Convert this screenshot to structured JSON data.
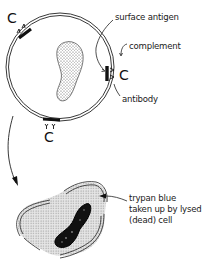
{
  "diagram": {
    "labels": {
      "surface_antigen": "surface antigen",
      "complement": "complement",
      "antibody": "antibody",
      "trypan_line1": "trypan blue",
      "trypan_line2": "taken up by lysed",
      "trypan_line3": "(dead) cell"
    },
    "complement_symbol": "C",
    "nodes": [
      {
        "id": "intact-cell",
        "description": "round cell with double membrane and kidney-shaped stippled nucleus"
      },
      {
        "id": "antigen-top-left",
        "description": "surface antigen patch with antibody and C bound"
      },
      {
        "id": "antigen-right",
        "description": "surface antigen patch with antibody and C bound"
      },
      {
        "id": "antigen-bottom",
        "description": "surface antigen patch with antibodies YY and C bound"
      },
      {
        "id": "lysed-cell",
        "description": "ruptured cell with broken membrane, stippled (stained) cytoplasm and dark nucleus"
      }
    ],
    "edges": [
      {
        "from": "intact-cell",
        "to": "lysed-cell",
        "description": "curved arrow indicating lysis"
      }
    ],
    "colors": {
      "ink": "#1a1a1a",
      "stipple": "#9a9a9a",
      "background": "#ffffff"
    }
  }
}
